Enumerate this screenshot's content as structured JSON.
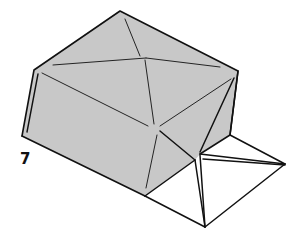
{
  "diagram": {
    "type": "origami-fold-step",
    "step_number": "7",
    "colors": {
      "paper_colored_side": "#c8c8c8",
      "paper_white_side": "#ffffff",
      "outline": "#111111"
    }
  }
}
